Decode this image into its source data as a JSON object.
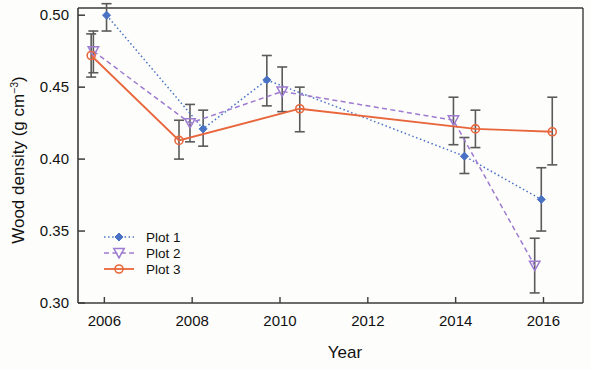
{
  "chart_data": {
    "type": "line",
    "title": "",
    "xlabel": "Year",
    "ylabel": "Wood density (g cm-3)",
    "ylabel_main": "Wood density (g cm",
    "ylabel_sup": "−3",
    "ylabel_tail": ")",
    "xlim": [
      2005.4,
      2016.9
    ],
    "ylim": [
      0.3,
      0.505
    ],
    "grid": false,
    "legend_position": "bottom-left",
    "xticks": [
      2006,
      2008,
      2010,
      2012,
      2014,
      2016
    ],
    "xtick_labels": [
      "2006",
      "2008",
      "2010",
      "2012",
      "2014",
      "2016"
    ],
    "yticks": [
      0.3,
      0.35,
      0.4,
      0.45,
      0.5
    ],
    "ytick_labels": [
      "0.30",
      "0.35",
      "0.40",
      "0.45",
      "0.50"
    ],
    "error_bars": true,
    "series": [
      {
        "name": "Plot 1",
        "color": "#4a72c4",
        "line_style": "dotted",
        "marker": "filled-diamond",
        "x": [
          2006.05,
          2008.25,
          2009.7,
          2014.2,
          2015.95
        ],
        "values": [
          0.5,
          0.421,
          0.455,
          0.402,
          0.372
        ],
        "err_low": [
          0.489,
          0.409,
          0.437,
          0.39,
          0.35
        ],
        "err_high": [
          0.508,
          0.434,
          0.472,
          0.415,
          0.394
        ]
      },
      {
        "name": "Plot 2",
        "color": "#9d7bd0",
        "line_style": "dashed",
        "marker": "open-triangle-down",
        "x": [
          2005.75,
          2007.95,
          2010.05,
          2013.95,
          2015.8
        ],
        "values": [
          0.475,
          0.425,
          0.447,
          0.427,
          0.326
        ],
        "err_low": [
          0.46,
          0.412,
          0.433,
          0.41,
          0.307
        ],
        "err_high": [
          0.489,
          0.438,
          0.464,
          0.443,
          0.345
        ]
      },
      {
        "name": "Plot 3",
        "color": "#e8663c",
        "line_style": "solid",
        "marker": "open-circle",
        "x": [
          2005.7,
          2007.7,
          2010.45,
          2014.45,
          2016.2
        ],
        "values": [
          0.472,
          0.413,
          0.435,
          0.421,
          0.419
        ],
        "err_low": [
          0.457,
          0.4,
          0.419,
          0.408,
          0.396
        ],
        "err_high": [
          0.487,
          0.427,
          0.45,
          0.434,
          0.443
        ]
      }
    ]
  },
  "legend": {
    "items": [
      {
        "label": "Plot 1"
      },
      {
        "label": "Plot 2"
      },
      {
        "label": "Plot 3"
      }
    ]
  }
}
